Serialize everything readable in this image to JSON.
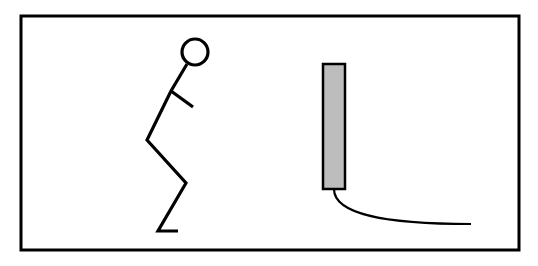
{
  "diagram": {
    "type": "illustration",
    "colors": {
      "stroke": "#000000",
      "background": "#ffffff",
      "device_fill": "#bdbdbd"
    },
    "frame": {
      "x": 21,
      "y": 16,
      "width": 498,
      "height": 234
    },
    "figure": {
      "head": {
        "cx": 195,
        "cy": 52,
        "r": 13
      },
      "joints": {
        "neck": [
          187,
          64
        ],
        "shoulder": [
          171,
          91
        ],
        "hand": [
          193,
          107
        ],
        "hip": [
          147,
          140
        ],
        "knee": [
          186,
          183
        ],
        "ankle": [
          158,
          231
        ],
        "toe": [
          178,
          231
        ]
      }
    },
    "device": {
      "x": 323,
      "y": 64,
      "width": 22,
      "height": 125
    },
    "cable": {
      "start": [
        334,
        189
      ],
      "end": [
        471,
        224
      ]
    }
  }
}
